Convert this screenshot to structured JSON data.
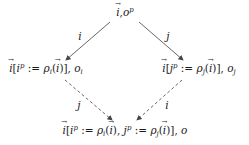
{
  "diagram": {
    "type": "commutative-diagram",
    "nodes": {
      "top": {
        "vec": "i",
        "sep": ",",
        "o": "o",
        "o_sup": "p"
      },
      "left": {
        "vec": "i",
        "open": "[",
        "var": "i",
        "var_sup": "p",
        "assign": " := ",
        "rho": "ρ",
        "rho_sub": "i",
        "arg": "i",
        "close": "],",
        "o": "o",
        "o_sub": "i"
      },
      "right": {
        "vec": "i",
        "open": "[",
        "var": "j",
        "var_sup": "p",
        "assign": " := ",
        "rho": "ρ",
        "rho_sub": "j",
        "arg": "i",
        "close": "],",
        "o": "o",
        "o_sub": "j"
      },
      "bottom": {
        "vec": "i",
        "open": "[",
        "var1": "i",
        "var1_sup": "p",
        "assign1": " := ",
        "rho1": "ρ",
        "rho1_sub": "i",
        "arg1": "i",
        "mid": "), ",
        "var2": "j",
        "var2_sup": "p",
        "assign2": " := ",
        "rho2": "ρ",
        "rho2_sub": "j",
        "arg2": "i",
        "close": ")],",
        "o": "o"
      }
    },
    "edges": [
      {
        "from": "top",
        "to": "left",
        "label": "i",
        "style": "solid"
      },
      {
        "from": "top",
        "to": "right",
        "label": "j",
        "style": "solid"
      },
      {
        "from": "left",
        "to": "bottom",
        "label": "j",
        "style": "dashed"
      },
      {
        "from": "right",
        "to": "bottom",
        "label": "i",
        "style": "dashed"
      }
    ],
    "colors": {
      "stroke": "#444444",
      "text": "#1a1a1a"
    }
  }
}
